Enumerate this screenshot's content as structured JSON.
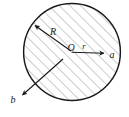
{
  "figure": {
    "background_color": "#ffffff",
    "stroke_color": "#1a1a1a",
    "hatch_color": "#8a8a8a",
    "circle": {
      "center_x": 72,
      "center_y": 52,
      "radius": 49,
      "stroke_width": 1.4
    },
    "hatching": {
      "angle_degrees": 45,
      "spacing_px": 7.5,
      "line_width": 0.8
    },
    "labels": [
      {
        "key": "center",
        "text": "O",
        "x": 71,
        "y": 51,
        "font_size": 10
      },
      {
        "key": "radius_R",
        "text": "R",
        "x": 53,
        "y": 35,
        "font_size": 10
      },
      {
        "key": "radius_r",
        "text": "r",
        "x": 84,
        "y": 49,
        "font_size": 9
      },
      {
        "key": "vector_a",
        "text": "a",
        "x": 112,
        "y": 58,
        "font_size": 10
      },
      {
        "key": "vector_b",
        "text": "b",
        "x": 13,
        "y": 103,
        "font_size": 10
      }
    ],
    "arrows": [
      {
        "key": "arrow-R",
        "from_x": 71,
        "from_y": 51,
        "to_x": 33,
        "to_y": 24,
        "description": "radius R from center to upper-left circle edge"
      },
      {
        "key": "arrow-a",
        "from_x": 71,
        "from_y": 52,
        "to_x": 106,
        "to_y": 53,
        "description": "radial distance r pointing right to point a"
      },
      {
        "key": "arrow-b",
        "from_x": 62,
        "from_y": 60,
        "to_x": 21,
        "to_y": 96,
        "description": "vector from inside circle to exterior point b"
      }
    ]
  }
}
